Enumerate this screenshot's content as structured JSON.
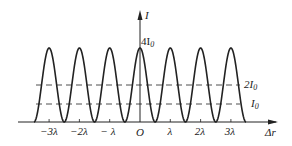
{
  "chart_data": {
    "type": "line",
    "title": "",
    "xlabel": "Δr",
    "ylabel": "I",
    "x_ticks": [
      "-3λ",
      "-2λ",
      "-λ",
      "O",
      "λ",
      "2λ",
      "3λ"
    ],
    "x_tick_values": [
      -3,
      -2,
      -1,
      0,
      1,
      2,
      3
    ],
    "peak_value_label": "4I₀",
    "peak_value": 4,
    "minimum_value": 0,
    "reference_lines": [
      {
        "label": "2I₀",
        "value": 2,
        "style": "dashed"
      },
      {
        "label": "I₀",
        "value": 1,
        "style": "dashed"
      }
    ],
    "function": "I = 4 I₀ cos²(π Δr / λ)",
    "x_range": [
      -3.5,
      3.5
    ],
    "ylim": [
      0,
      4
    ]
  },
  "labels": {
    "y_axis": "I",
    "x_axis": "Δr",
    "peak": "4I",
    "peak_sub": "0",
    "line_2i0": "2I",
    "line_2i0_sub": "0",
    "line_i0": "I",
    "line_i0_sub": "0",
    "ticks": [
      "−3λ",
      "−2λ",
      "− λ",
      "O",
      "λ",
      "2λ",
      "3λ"
    ]
  },
  "colors": {
    "ink": "#222222",
    "background": "#ffffff"
  }
}
